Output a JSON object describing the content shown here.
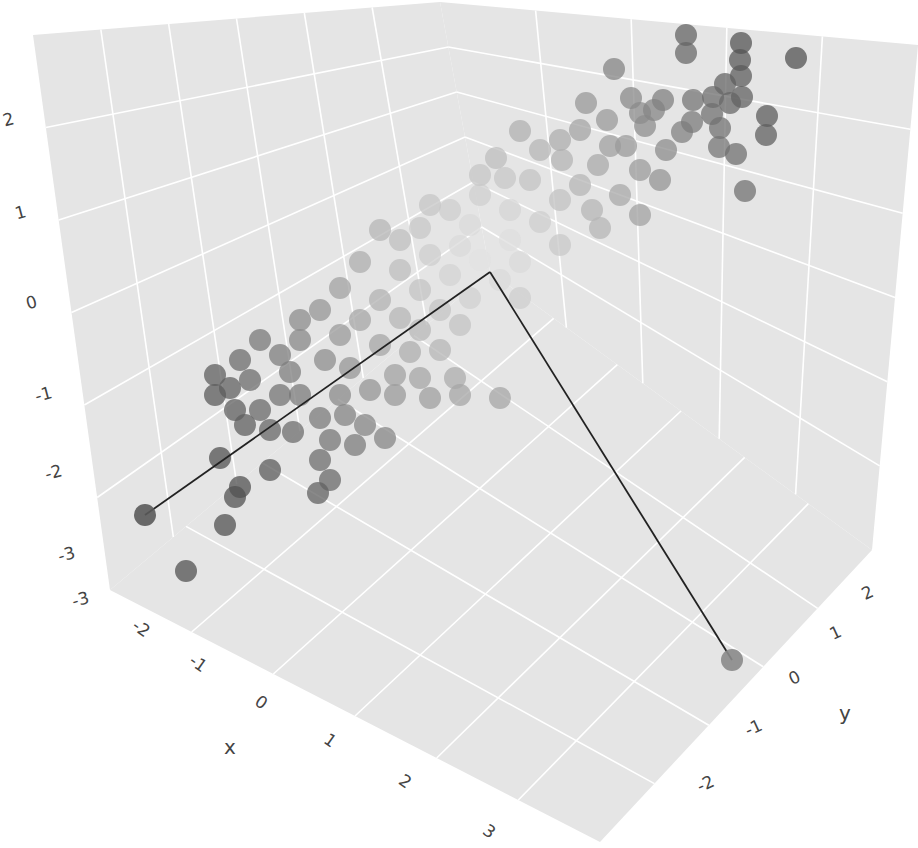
{
  "chart_data": {
    "type": "scatter3d",
    "title": "",
    "axes": {
      "x": {
        "label": "x",
        "range": [
          -3,
          3.3
        ],
        "ticks": [
          "-3",
          "-2",
          "-1",
          "0",
          "1",
          "2",
          "3"
        ]
      },
      "y": {
        "label": "y",
        "range": [
          -2.5,
          2.5
        ],
        "ticks": [
          "-2",
          "-1",
          "0",
          "1",
          "2"
        ]
      },
      "z": {
        "label": "",
        "range": [
          -3.2,
          2.6
        ],
        "ticks": [
          "-3",
          "-2",
          "-1",
          "0",
          "1",
          "2"
        ]
      }
    },
    "grid": true,
    "background_color": "#e5e5e5",
    "gridline_color": "#ffffff",
    "marker": {
      "size": 11,
      "opacity": 0.75,
      "colorscale": "grayscale by |distance from center|",
      "dark_color": "#555555",
      "light_color": "#e8e8e8"
    },
    "lines": [
      {
        "name": "line-to-left-outlier",
        "from_px": [
          490,
          272
        ],
        "to_px": [
          145,
          515
        ],
        "color": "#222222"
      },
      {
        "name": "line-to-right-outlier",
        "from_px": [
          490,
          272
        ],
        "to_px": [
          732,
          660
        ],
        "color": "#222222"
      }
    ],
    "highlighted_points_px": [
      [
        145,
        515
      ],
      [
        732,
        660
      ]
    ],
    "points_px": [
      [
        686,
        35
      ],
      [
        741,
        43
      ],
      [
        796,
        58
      ],
      [
        740,
        60
      ],
      [
        741,
        76
      ],
      [
        614,
        69
      ],
      [
        686,
        53
      ],
      [
        725,
        84
      ],
      [
        742,
        97
      ],
      [
        631,
        98
      ],
      [
        663,
        100
      ],
      [
        693,
        100
      ],
      [
        713,
        97
      ],
      [
        712,
        114
      ],
      [
        730,
        103
      ],
      [
        767,
        116
      ],
      [
        766,
        135
      ],
      [
        720,
        128
      ],
      [
        719,
        147
      ],
      [
        736,
        154
      ],
      [
        745,
        191
      ],
      [
        692,
        122
      ],
      [
        682,
        132
      ],
      [
        654,
        110
      ],
      [
        640,
        113
      ],
      [
        645,
        126
      ],
      [
        607,
        120
      ],
      [
        586,
        103
      ],
      [
        610,
        146
      ],
      [
        626,
        146
      ],
      [
        666,
        150
      ],
      [
        580,
        130
      ],
      [
        560,
        140
      ],
      [
        520,
        131
      ],
      [
        540,
        150
      ],
      [
        562,
        160
      ],
      [
        598,
        165
      ],
      [
        640,
        170
      ],
      [
        660,
        180
      ],
      [
        496,
        158
      ],
      [
        480,
        175
      ],
      [
        505,
        178
      ],
      [
        530,
        180
      ],
      [
        580,
        185
      ],
      [
        620,
        195
      ],
      [
        560,
        200
      ],
      [
        592,
        210
      ],
      [
        480,
        195
      ],
      [
        450,
        210
      ],
      [
        430,
        205
      ],
      [
        510,
        210
      ],
      [
        540,
        222
      ],
      [
        470,
        225
      ],
      [
        420,
        228
      ],
      [
        600,
        228
      ],
      [
        640,
        215
      ],
      [
        510,
        240
      ],
      [
        460,
        246
      ],
      [
        400,
        240
      ],
      [
        380,
        230
      ],
      [
        560,
        245
      ],
      [
        430,
        255
      ],
      [
        480,
        260
      ],
      [
        520,
        262
      ],
      [
        450,
        275
      ],
      [
        400,
        270
      ],
      [
        360,
        262
      ],
      [
        500,
        280
      ],
      [
        420,
        290
      ],
      [
        380,
        300
      ],
      [
        340,
        288
      ],
      [
        470,
        298
      ],
      [
        520,
        298
      ],
      [
        440,
        310
      ],
      [
        320,
        310
      ],
      [
        300,
        320
      ],
      [
        360,
        320
      ],
      [
        400,
        318
      ],
      [
        420,
        330
      ],
      [
        340,
        335
      ],
      [
        300,
        340
      ],
      [
        460,
        325
      ],
      [
        380,
        345
      ],
      [
        410,
        352
      ],
      [
        440,
        350
      ],
      [
        260,
        340
      ],
      [
        280,
        355
      ],
      [
        240,
        360
      ],
      [
        215,
        375
      ],
      [
        230,
        388
      ],
      [
        250,
        380
      ],
      [
        290,
        372
      ],
      [
        325,
        360
      ],
      [
        350,
        368
      ],
      [
        395,
        375
      ],
      [
        420,
        378
      ],
      [
        455,
        378
      ],
      [
        500,
        398
      ],
      [
        215,
        395
      ],
      [
        235,
        410
      ],
      [
        260,
        410
      ],
      [
        280,
        395
      ],
      [
        300,
        395
      ],
      [
        340,
        395
      ],
      [
        370,
        390
      ],
      [
        395,
        395
      ],
      [
        430,
        398
      ],
      [
        460,
        395
      ],
      [
        245,
        425
      ],
      [
        270,
        430
      ],
      [
        293,
        432
      ],
      [
        320,
        418
      ],
      [
        345,
        415
      ],
      [
        365,
        425
      ],
      [
        385,
        438
      ],
      [
        330,
        440
      ],
      [
        355,
        445
      ],
      [
        320,
        460
      ],
      [
        330,
        480
      ],
      [
        318,
        493
      ],
      [
        240,
        487
      ],
      [
        235,
        497
      ],
      [
        225,
        525
      ],
      [
        220,
        458
      ],
      [
        270,
        470
      ],
      [
        186,
        571
      ]
    ],
    "point_shades": "computed"
  },
  "labels": {
    "z_ticks": [
      {
        "text": "2",
        "x": 10,
        "y": 125
      },
      {
        "text": "1",
        "x": 22,
        "y": 218
      },
      {
        "text": "0",
        "x": 33,
        "y": 308
      },
      {
        "text": "-1",
        "x": 45,
        "y": 400
      },
      {
        "text": "-2",
        "x": 55,
        "y": 478
      },
      {
        "text": "-3",
        "x": 68,
        "y": 560
      },
      {
        "text": "-3",
        "x": 82,
        "y": 605
      }
    ],
    "x_ticks": [
      {
        "text": "-2",
        "x": 138,
        "y": 633
      },
      {
        "text": "-1",
        "x": 195,
        "y": 668
      },
      {
        "text": "0",
        "x": 258,
        "y": 707
      },
      {
        "text": "1",
        "x": 327,
        "y": 745
      },
      {
        "text": "2",
        "x": 402,
        "y": 786
      },
      {
        "text": "3",
        "x": 486,
        "y": 836
      }
    ],
    "y_ticks": [
      {
        "text": "2",
        "x": 870,
        "y": 598
      },
      {
        "text": "1",
        "x": 838,
        "y": 638
      },
      {
        "text": "0",
        "x": 797,
        "y": 683
      },
      {
        "text": "-1",
        "x": 756,
        "y": 733
      },
      {
        "text": "-2",
        "x": 708,
        "y": 789
      }
    ],
    "x_title": {
      "text": "x",
      "x": 230,
      "y": 754
    },
    "y_title": {
      "text": "y",
      "x": 845,
      "y": 720
    }
  }
}
